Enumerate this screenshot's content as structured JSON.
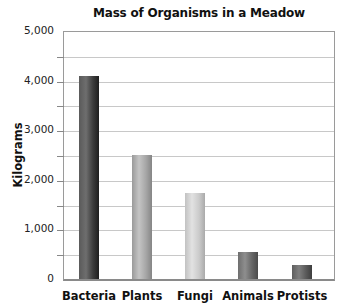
{
  "chart_data": {
    "type": "bar",
    "title": "Mass of Organisms in a Meadow",
    "xlabel": "",
    "ylabel": "Kilograms",
    "categories": [
      "Bacteria",
      "Plants",
      "Fungi",
      "Animals",
      "Protists"
    ],
    "values": [
      4100,
      2500,
      1730,
      540,
      280
    ],
    "ylim": [
      0,
      5000
    ],
    "yticks": [
      "0",
      "1,000",
      "2,000",
      "3,000",
      "4,000",
      "5,000"
    ],
    "minor_gridlines_every": 500,
    "grid": true,
    "legend": "none",
    "bar_colors": [
      "#3a3a3a",
      "#a8a8a8",
      "#cfcfcf",
      "#6a6a6a",
      "#5a5a5a"
    ]
  },
  "labels": {
    "title": "Mass of Organisms in a Meadow",
    "ylabel": "Kilograms",
    "yticks": [
      "0",
      "1,000",
      "2,000",
      "3,000",
      "4,000",
      "5,000"
    ],
    "categories": [
      "Bacteria",
      "Plants",
      "Fungi",
      "Animals",
      "Protists"
    ]
  }
}
